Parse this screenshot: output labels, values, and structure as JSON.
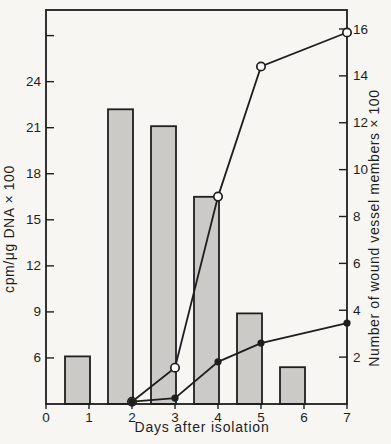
{
  "figure": {
    "background_color": "#f7f6f2",
    "ink_color": "#1e1e1e"
  },
  "chart_data": {
    "type": "combo-bar-line",
    "x_axis": {
      "label": "Days after isolation",
      "ticks": [
        0,
        1,
        2,
        3,
        4,
        5,
        6,
        7
      ],
      "range": [
        0,
        7
      ]
    },
    "left_axis": {
      "label": "cpm/μg DNA × 100",
      "ticks": [
        6,
        9,
        12,
        15,
        18,
        21,
        24
      ],
      "unlabeled_ticks": [
        27
      ],
      "baseline_value": 3,
      "range": [
        3,
        28.7
      ]
    },
    "right_axis": {
      "label": "Number of wound vessel members × 100",
      "ticks": [
        2,
        4,
        6,
        8,
        10,
        12,
        14,
        16
      ],
      "baseline_value": 0,
      "range": [
        0,
        16.8
      ]
    },
    "bars": {
      "name": "dna-synthesis-bars",
      "axis": "left",
      "fill": "#cbcac7",
      "stroke": "#1e1e1e",
      "categories": [
        1,
        2,
        3,
        4,
        5,
        6
      ],
      "values": [
        6.1,
        22.2,
        21.1,
        16.5,
        8.9,
        5.4
      ]
    },
    "series": [
      {
        "name": "wound-vessel-members-open-circle",
        "axis": "right",
        "marker": "open-circle",
        "color": "#1e1e1e",
        "points": [
          [
            2,
            0.1
          ],
          [
            3,
            1.55
          ],
          [
            4,
            8.85
          ],
          [
            5,
            14.4
          ],
          [
            7,
            15.85
          ]
        ]
      },
      {
        "name": "wound-vessel-members-filled-circle",
        "axis": "right",
        "marker": "filled-circle",
        "color": "#1e1e1e",
        "points": [
          [
            2,
            0.1
          ],
          [
            3,
            0.25
          ],
          [
            4,
            1.8
          ],
          [
            5,
            2.6
          ],
          [
            7,
            3.45
          ]
        ]
      }
    ],
    "legend": null,
    "grid": false
  }
}
